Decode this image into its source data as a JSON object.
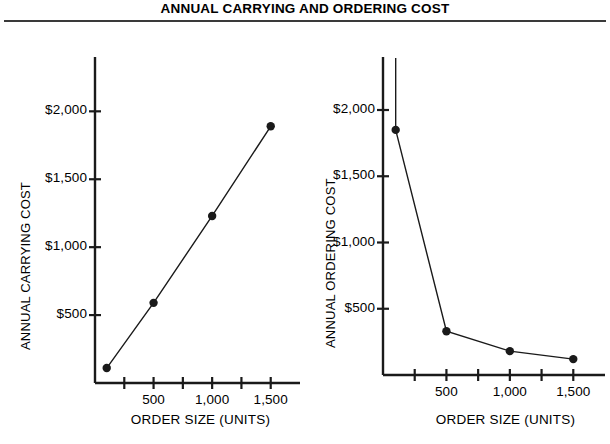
{
  "figure": {
    "title": "ANNUAL CARRYING AND ORDERING COST"
  },
  "chart_data": [
    {
      "type": "line",
      "title": "",
      "panel": "left",
      "xlabel": "ORDER SIZE (UNITS)",
      "ylabel": "ANNUAL CARRYING COST",
      "x": [
        100,
        500,
        1000,
        1500
      ],
      "values": [
        110,
        590,
        1230,
        1890
      ],
      "xlim": [
        0,
        1750
      ],
      "ylim": [
        0,
        2400
      ],
      "xticks": [
        250,
        500,
        750,
        1000,
        1250,
        1500
      ],
      "xtick_labels": [
        "",
        "500",
        "",
        "1,000",
        "",
        "1,500"
      ],
      "yticks": [
        500,
        1000,
        1500,
        2000
      ],
      "ytick_labels": [
        "$500",
        "$1,000",
        "$1,500",
        "$2,000"
      ],
      "grid": false,
      "legend": "none",
      "marker": "filled-circle",
      "line_color": "#1a1a1a"
    },
    {
      "type": "line",
      "title": "",
      "panel": "right",
      "xlabel": "ORDER SIZE (UNITS)",
      "ylabel": "ANNUAL ORDERING COST",
      "x": [
        100,
        500,
        1000,
        1500
      ],
      "values": [
        1850,
        330,
        180,
        120
      ],
      "xlim": [
        0,
        1750
      ],
      "ylim": [
        0,
        2400
      ],
      "xticks": [
        250,
        500,
        750,
        1000,
        1250,
        1500
      ],
      "xtick_labels": [
        "",
        "500",
        "",
        "1,000",
        "",
        "1,500"
      ],
      "yticks": [
        500,
        1000,
        1500,
        2000
      ],
      "ytick_labels": [
        "$500",
        "$1,000",
        "$1,500",
        "$2,000"
      ],
      "grid": false,
      "legend": "none",
      "marker": "filled-circle",
      "line_color": "#1a1a1a",
      "note": "curve continues upward off the top of the axis at the left edge"
    }
  ],
  "axis_labels": {
    "left_y": "ANNUAL CARRYING COST",
    "right_y": "ANNUAL ORDERING COST",
    "left_x": "ORDER SIZE (UNITS)",
    "right_x": "ORDER SIZE (UNITS)"
  },
  "colors": {
    "ink": "#1a1a1a",
    "rule": "#3a3a3a",
    "background": "#ffffff"
  }
}
